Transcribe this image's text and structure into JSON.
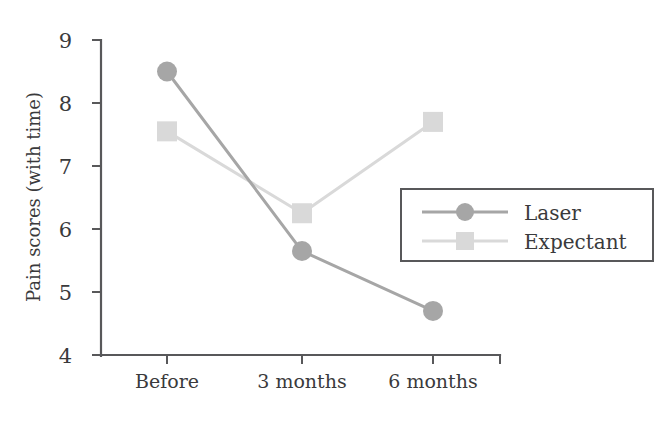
{
  "chart_data": {
    "type": "line",
    "title": "",
    "xlabel": "",
    "ylabel": "Pain scores (with time)",
    "categories": [
      "Before",
      "3 months",
      "6 months"
    ],
    "ylim": [
      4,
      9
    ],
    "yticks": [
      4,
      5,
      6,
      7,
      8,
      9
    ],
    "ytick_labels": [
      "4",
      "5",
      "6",
      "7",
      "8",
      "9"
    ],
    "grid": false,
    "legend_position": "center-right",
    "series": [
      {
        "name": "Laser",
        "values": [
          8.5,
          5.65,
          4.7
        ],
        "color": "#a6a6a6",
        "marker": "circle"
      },
      {
        "name": "Expectant",
        "values": [
          7.55,
          6.25,
          7.7
        ],
        "color": "#d9d9d9",
        "marker": "square"
      }
    ]
  },
  "axes": {
    "y_axis_label": "Pain scores (with time)",
    "y_tick_0": "4",
    "y_tick_1": "5",
    "y_tick_2": "6",
    "y_tick_3": "7",
    "y_tick_4": "8",
    "y_tick_5": "9",
    "x_tick_0": "Before",
    "x_tick_1": "3 months",
    "x_tick_2": "6 months"
  },
  "legend": {
    "entry_0": "Laser",
    "entry_1": "Expectant"
  }
}
